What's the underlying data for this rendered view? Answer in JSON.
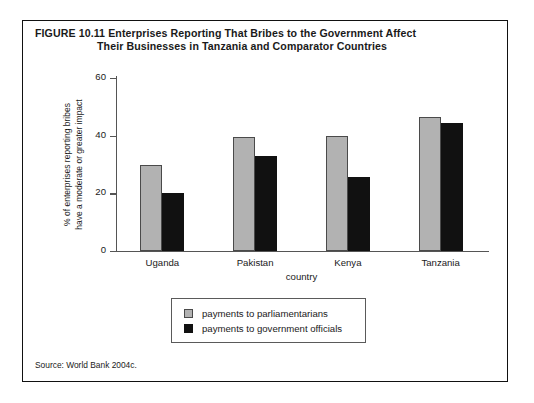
{
  "figure": {
    "number_label": "FIGURE 10.11",
    "title_line1": "Enterprises Reporting That Bribes to the Government Affect",
    "title_line2": "Their Businesses in Tanzania and Comparator Countries",
    "source_note": "Source: World Bank 2004c."
  },
  "colors": {
    "series_gray": "#b2b2b2",
    "series_black": "#111111",
    "axis": "#555555",
    "frame": "#111111",
    "text": "#1a1a1a"
  },
  "chart_data": {
    "type": "bar",
    "title": "Enterprises Reporting That Bribes to the Government Affect Their Businesses in Tanzania and Comparator Countries",
    "categories": [
      "Uganda",
      "Pakistan",
      "Kenya",
      "Tanzania"
    ],
    "series": [
      {
        "name": "payments to parliamentarians",
        "color": "#b2b2b2",
        "values": [
          30,
          39.5,
          40,
          46.5
        ]
      },
      {
        "name": "payments to government officials",
        "color": "#111111",
        "values": [
          20,
          33,
          25.5,
          44.5
        ]
      }
    ],
    "xlabel": "country",
    "ylabel": "% of enterprises reporting bribes have a moderate or greater impact",
    "ylabel_line1": "% of enterprises reporting bribes",
    "ylabel_line2": "have a moderate or greater impact",
    "ylim": [
      0,
      60
    ],
    "yticks": [
      0,
      20,
      40,
      60
    ],
    "grid": false,
    "legend_position": "below-center"
  }
}
